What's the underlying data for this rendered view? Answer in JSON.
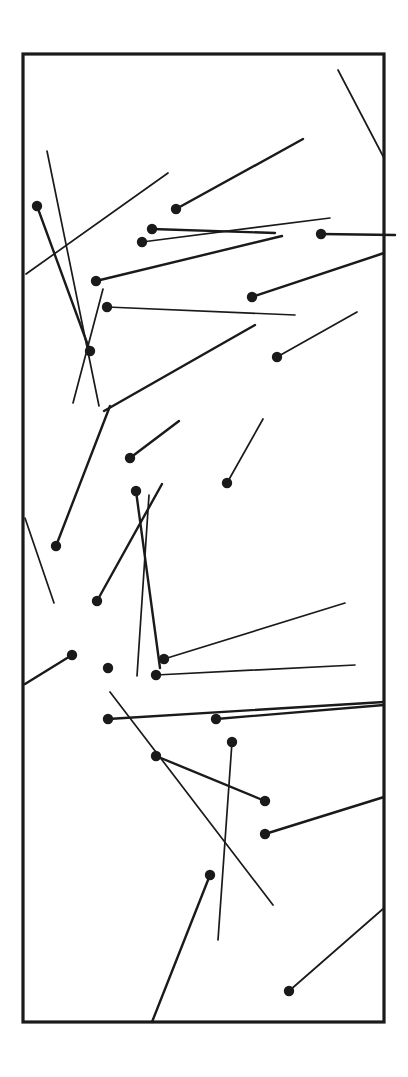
{
  "figure": {
    "width": 408,
    "height": 1077,
    "background_color": "#ffffff",
    "ink_color": "#1a1a1a",
    "frame": {
      "x": 23,
      "y": 54,
      "width": 361,
      "height": 968,
      "stroke_color": "#1a1a1a",
      "stroke_width": 3.2
    },
    "dot_radius": 5.2,
    "default_stroke_width": 1.7,
    "heavy_stroke_width": 2.4
  },
  "chart_data": {
    "type": "scatter",
    "title": "",
    "xlabel": "",
    "ylabel": "",
    "xlim": [
      23,
      384
    ],
    "ylim": [
      54,
      1022
    ],
    "grid": false,
    "legend": "none",
    "segment_count": 29,
    "dot_count": 29,
    "segments": [
      {
        "id": "seg-01",
        "x1": 338,
        "y1": 70,
        "x2": 384,
        "y2": 158,
        "weight": "normal",
        "has_dot": false
      },
      {
        "id": "seg-02",
        "x1": 176,
        "y1": 209,
        "x2": 303,
        "y2": 139,
        "weight": "heavy",
        "has_dot": true,
        "dot_at": "start"
      },
      {
        "id": "seg-03",
        "x1": 26,
        "y1": 274,
        "x2": 168,
        "y2": 173,
        "weight": "normal",
        "has_dot": false
      },
      {
        "id": "seg-04",
        "x1": 47,
        "y1": 151,
        "x2": 99,
        "y2": 406,
        "weight": "normal",
        "has_dot": false
      },
      {
        "id": "seg-05",
        "x1": 37,
        "y1": 206,
        "x2": 90,
        "y2": 351,
        "weight": "heavy",
        "has_dot": true,
        "dot_at": "start"
      },
      {
        "id": "seg-06",
        "x1": 152,
        "y1": 229,
        "x2": 275,
        "y2": 233,
        "weight": "heavy",
        "has_dot": true,
        "dot_at": "start"
      },
      {
        "id": "seg-07",
        "x1": 321,
        "y1": 234,
        "x2": 395,
        "y2": 235,
        "weight": "heavy",
        "has_dot": true,
        "dot_at": "start"
      },
      {
        "id": "seg-08",
        "x1": 142,
        "y1": 242,
        "x2": 330,
        "y2": 218,
        "weight": "normal",
        "has_dot": true,
        "dot_at": "start"
      },
      {
        "id": "seg-09",
        "x1": 96,
        "y1": 281,
        "x2": 282,
        "y2": 236,
        "weight": "heavy",
        "has_dot": true,
        "dot_at": "start"
      },
      {
        "id": "seg-10",
        "x1": 252,
        "y1": 297,
        "x2": 384,
        "y2": 253,
        "weight": "heavy",
        "has_dot": true,
        "dot_at": "start"
      },
      {
        "id": "seg-11",
        "x1": 107,
        "y1": 307,
        "x2": 295,
        "y2": 315,
        "weight": "normal",
        "has_dot": true,
        "dot_at": "start"
      },
      {
        "id": "seg-12",
        "x1": 277,
        "y1": 357,
        "x2": 357,
        "y2": 312,
        "weight": "normal",
        "has_dot": true,
        "dot_at": "start"
      },
      {
        "id": "seg-13",
        "x1": 104,
        "y1": 411,
        "x2": 255,
        "y2": 325,
        "weight": "heavy",
        "has_dot": false
      },
      {
        "id": "seg-14",
        "x1": 73,
        "y1": 403,
        "x2": 103,
        "y2": 289,
        "weight": "normal",
        "has_dot": false
      },
      {
        "id": "seg-15",
        "x1": 130,
        "y1": 458,
        "x2": 179,
        "y2": 421,
        "weight": "heavy",
        "has_dot": true,
        "dot_at": "start"
      },
      {
        "id": "seg-16",
        "x1": 227,
        "y1": 483,
        "x2": 263,
        "y2": 419,
        "weight": "normal",
        "has_dot": true,
        "dot_at": "start"
      },
      {
        "id": "seg-17",
        "x1": 56,
        "y1": 546,
        "x2": 110,
        "y2": 406,
        "weight": "heavy",
        "has_dot": true,
        "dot_at": "start"
      },
      {
        "id": "seg-18",
        "x1": 25,
        "y1": 518,
        "x2": 54,
        "y2": 603,
        "weight": "normal",
        "has_dot": false
      },
      {
        "id": "seg-19",
        "x1": 136,
        "y1": 491,
        "x2": 160,
        "y2": 668,
        "weight": "heavy",
        "has_dot": true,
        "dot_at": "start"
      },
      {
        "id": "seg-20",
        "x1": 97,
        "y1": 601,
        "x2": 162,
        "y2": 484,
        "weight": "heavy",
        "has_dot": true,
        "dot_at": "start"
      },
      {
        "id": "seg-21",
        "x1": 149,
        "y1": 495,
        "x2": 137,
        "y2": 676,
        "weight": "normal",
        "has_dot": false
      },
      {
        "id": "seg-22",
        "x1": 72,
        "y1": 655,
        "x2": 25,
        "y2": 684,
        "weight": "heavy",
        "has_dot": true,
        "dot_at": "start"
      },
      {
        "id": "seg-23",
        "x1": 164,
        "y1": 659,
        "x2": 345,
        "y2": 603,
        "weight": "normal",
        "has_dot": true,
        "dot_at": "start"
      },
      {
        "id": "seg-24",
        "x1": 156,
        "y1": 675,
        "x2": 355,
        "y2": 665,
        "weight": "normal",
        "has_dot": true,
        "dot_at": "start"
      },
      {
        "id": "seg-25",
        "x1": 108,
        "y1": 719,
        "x2": 384,
        "y2": 702,
        "weight": "heavy",
        "has_dot": true,
        "dot_at": "start"
      },
      {
        "id": "seg-26",
        "x1": 110,
        "y1": 692,
        "x2": 273,
        "y2": 905,
        "weight": "normal",
        "has_dot": false
      },
      {
        "id": "seg-27",
        "x1": 216,
        "y1": 719,
        "x2": 384,
        "y2": 705,
        "weight": "heavy",
        "has_dot": true,
        "dot_at": "start"
      },
      {
        "id": "seg-28",
        "x1": 232,
        "y1": 742,
        "x2": 218,
        "y2": 940,
        "weight": "normal",
        "has_dot": true,
        "dot_at": "start"
      },
      {
        "id": "seg-29",
        "x1": 156,
        "y1": 756,
        "x2": 265,
        "y2": 801,
        "weight": "heavy",
        "has_dot": true,
        "dot_at": "start"
      },
      {
        "id": "seg-30",
        "x1": 265,
        "y1": 834,
        "x2": 384,
        "y2": 797,
        "weight": "heavy",
        "has_dot": true,
        "dot_at": "start"
      },
      {
        "id": "seg-31",
        "x1": 210,
        "y1": 875,
        "x2": 152,
        "y2": 1022,
        "weight": "heavy",
        "has_dot": true,
        "dot_at": "start"
      },
      {
        "id": "seg-32",
        "x1": 289,
        "y1": 991,
        "x2": 384,
        "y2": 908,
        "weight": "normal",
        "has_dot": true,
        "dot_at": "start"
      }
    ],
    "dots": [
      {
        "id": "dot-01",
        "x": 37,
        "y": 206
      },
      {
        "id": "dot-02",
        "x": 176,
        "y": 209
      },
      {
        "id": "dot-03",
        "x": 152,
        "y": 229
      },
      {
        "id": "dot-04",
        "x": 321,
        "y": 234
      },
      {
        "id": "dot-05",
        "x": 142,
        "y": 242
      },
      {
        "id": "dot-06",
        "x": 96,
        "y": 281
      },
      {
        "id": "dot-07",
        "x": 252,
        "y": 297
      },
      {
        "id": "dot-08",
        "x": 107,
        "y": 307
      },
      {
        "id": "dot-09",
        "x": 90,
        "y": 351
      },
      {
        "id": "dot-10",
        "x": 277,
        "y": 357
      },
      {
        "id": "dot-11",
        "x": 130,
        "y": 458
      },
      {
        "id": "dot-12",
        "x": 227,
        "y": 483
      },
      {
        "id": "dot-13",
        "x": 136,
        "y": 491
      },
      {
        "id": "dot-14",
        "x": 56,
        "y": 546
      },
      {
        "id": "dot-15",
        "x": 97,
        "y": 601
      },
      {
        "id": "dot-16",
        "x": 72,
        "y": 655
      },
      {
        "id": "dot-17",
        "x": 164,
        "y": 659
      },
      {
        "id": "dot-18",
        "x": 108,
        "y": 668
      },
      {
        "id": "dot-19",
        "x": 156,
        "y": 675
      },
      {
        "id": "dot-20",
        "x": 108,
        "y": 719
      },
      {
        "id": "dot-21",
        "x": 216,
        "y": 719
      },
      {
        "id": "dot-22",
        "x": 232,
        "y": 742
      },
      {
        "id": "dot-23",
        "x": 156,
        "y": 756
      },
      {
        "id": "dot-24",
        "x": 265,
        "y": 801
      },
      {
        "id": "dot-25",
        "x": 265,
        "y": 834
      },
      {
        "id": "dot-26",
        "x": 210,
        "y": 875
      },
      {
        "id": "dot-27",
        "x": 289,
        "y": 991
      }
    ]
  }
}
